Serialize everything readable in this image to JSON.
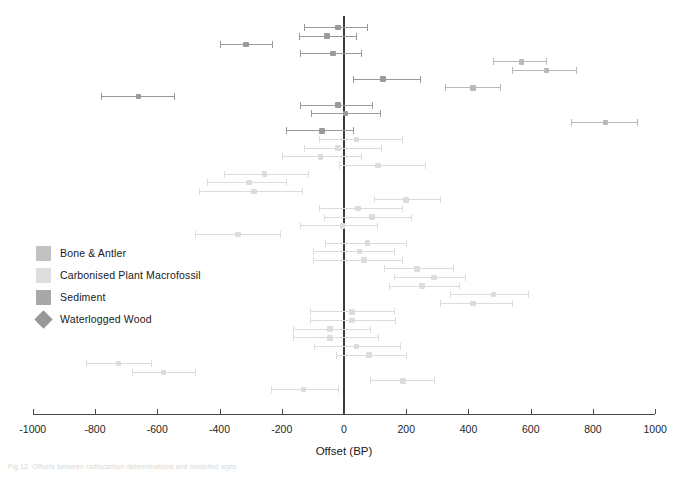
{
  "figure": {
    "caption": "Fig 12. Offsets between radiocarbon determinations and modelled ages"
  },
  "chart_data": {
    "type": "scatter",
    "title": "",
    "xlabel": "Offset (BP)",
    "ylabel": "",
    "xlim": [
      -1000,
      1000
    ],
    "xticks": [
      -1000,
      -800,
      -600,
      -400,
      -200,
      0,
      200,
      400,
      600,
      800,
      1000
    ],
    "xticklabels": [
      "-1000",
      "-800",
      "-600",
      "-400",
      "-200",
      "0",
      "200",
      "400",
      "600",
      "800",
      "1000"
    ],
    "grid": false,
    "reference_line": 0,
    "legend_position": "left-middle",
    "orientation": "horizontal-error-bars",
    "error_bar_note": "Each row shows a central offset estimate with a horizontal uncertainty interval.",
    "series": [
      {
        "name": "Bone & Antler",
        "color": "#b9b9b9",
        "marker": "square"
      },
      {
        "name": "Carbonised Plant Macrofossil",
        "color": "#dcdcdc",
        "marker": "square"
      },
      {
        "name": "Sediment",
        "color": "#9a9a9a",
        "marker": "square"
      },
      {
        "name": "Waterlogged Wood",
        "color": "#8e8e8e",
        "marker": "diamond"
      }
    ],
    "points": [
      {
        "row": 1,
        "offset": -20,
        "low": -130,
        "high": 75,
        "series": "Sediment"
      },
      {
        "row": 2,
        "offset": -55,
        "low": -145,
        "high": 40,
        "series": "Sediment"
      },
      {
        "row": 3,
        "offset": -315,
        "low": -400,
        "high": -230,
        "series": "Sediment"
      },
      {
        "row": 4,
        "offset": -35,
        "low": -140,
        "high": 55,
        "series": "Sediment"
      },
      {
        "row": 5,
        "offset": 570,
        "low": 480,
        "high": 650,
        "series": "Bone & Antler"
      },
      {
        "row": 6,
        "offset": 650,
        "low": 540,
        "high": 745,
        "series": "Bone & Antler"
      },
      {
        "row": 7,
        "offset": 125,
        "low": 30,
        "high": 245,
        "series": "Sediment"
      },
      {
        "row": 8,
        "offset": 415,
        "low": 325,
        "high": 500,
        "series": "Bone & Antler"
      },
      {
        "row": 9,
        "offset": -660,
        "low": -780,
        "high": -545,
        "series": "Sediment"
      },
      {
        "row": 10,
        "offset": -20,
        "low": -140,
        "high": 90,
        "series": "Sediment"
      },
      {
        "row": 11,
        "offset": 5,
        "low": -105,
        "high": 115,
        "series": "Sediment"
      },
      {
        "row": 12,
        "offset": 840,
        "low": 730,
        "high": 940,
        "series": "Bone & Antler"
      },
      {
        "row": 13,
        "offset": -70,
        "low": -185,
        "high": 30,
        "series": "Sediment"
      },
      {
        "row": 14,
        "offset": 40,
        "low": -80,
        "high": 185,
        "series": "Carbonised Plant Macrofossil"
      },
      {
        "row": 15,
        "offset": -20,
        "low": -130,
        "high": 120,
        "series": "Carbonised Plant Macrofossil"
      },
      {
        "row": 16,
        "offset": -75,
        "low": -200,
        "high": 55,
        "series": "Carbonised Plant Macrofossil"
      },
      {
        "row": 17,
        "offset": 110,
        "low": -15,
        "high": 260,
        "series": "Carbonised Plant Macrofossil"
      },
      {
        "row": 18,
        "offset": -255,
        "low": -385,
        "high": -115,
        "series": "Carbonised Plant Macrofossil"
      },
      {
        "row": 19,
        "offset": -305,
        "low": -440,
        "high": -185,
        "series": "Carbonised Plant Macrofossil"
      },
      {
        "row": 20,
        "offset": -290,
        "low": -465,
        "high": -135,
        "series": "Carbonised Plant Macrofossil"
      },
      {
        "row": 21,
        "offset": 200,
        "low": 95,
        "high": 310,
        "series": "Carbonised Plant Macrofossil"
      },
      {
        "row": 22,
        "offset": 45,
        "low": -80,
        "high": 185,
        "series": "Carbonised Plant Macrofossil"
      },
      {
        "row": 23,
        "offset": 90,
        "low": -65,
        "high": 215,
        "series": "Carbonised Plant Macrofossil"
      },
      {
        "row": 24,
        "offset": -5,
        "low": -140,
        "high": 105,
        "series": "Carbonised Plant Macrofossil"
      },
      {
        "row": 25,
        "offset": -340,
        "low": -480,
        "high": -205,
        "series": "Carbonised Plant Macrofossil"
      },
      {
        "row": 26,
        "offset": 75,
        "low": -60,
        "high": 200,
        "series": "Carbonised Plant Macrofossil"
      },
      {
        "row": 27,
        "offset": 50,
        "low": -100,
        "high": 160,
        "series": "Carbonised Plant Macrofossil"
      },
      {
        "row": 28,
        "offset": 65,
        "low": -100,
        "high": 185,
        "series": "Carbonised Plant Macrofossil"
      },
      {
        "row": 29,
        "offset": 235,
        "low": 130,
        "high": 350,
        "series": "Carbonised Plant Macrofossil"
      },
      {
        "row": 30,
        "offset": 290,
        "low": 160,
        "high": 390,
        "series": "Carbonised Plant Macrofossil"
      },
      {
        "row": 31,
        "offset": 250,
        "low": 145,
        "high": 370,
        "series": "Carbonised Plant Macrofossil"
      },
      {
        "row": 32,
        "offset": 480,
        "low": 340,
        "high": 590,
        "series": "Carbonised Plant Macrofossil"
      },
      {
        "row": 33,
        "offset": 415,
        "low": 310,
        "high": 540,
        "series": "Carbonised Plant Macrofossil"
      },
      {
        "row": 34,
        "offset": 25,
        "low": -110,
        "high": 160,
        "series": "Carbonised Plant Macrofossil"
      },
      {
        "row": 35,
        "offset": 25,
        "low": -110,
        "high": 165,
        "series": "Carbonised Plant Macrofossil"
      },
      {
        "row": 36,
        "offset": -45,
        "low": -165,
        "high": 85,
        "series": "Carbonised Plant Macrofossil"
      },
      {
        "row": 37,
        "offset": -45,
        "low": -165,
        "high": 110,
        "series": "Carbonised Plant Macrofossil"
      },
      {
        "row": 38,
        "offset": 40,
        "low": -95,
        "high": 180,
        "series": "Carbonised Plant Macrofossil"
      },
      {
        "row": 39,
        "offset": 80,
        "low": -25,
        "high": 200,
        "series": "Carbonised Plant Macrofossil"
      },
      {
        "row": 40,
        "offset": -725,
        "low": -830,
        "high": -620,
        "series": "Carbonised Plant Macrofossil"
      },
      {
        "row": 41,
        "offset": -580,
        "low": -680,
        "high": -480,
        "series": "Carbonised Plant Macrofossil"
      },
      {
        "row": 42,
        "offset": 190,
        "low": 85,
        "high": 290,
        "series": "Carbonised Plant Macrofossil"
      },
      {
        "row": 43,
        "offset": -130,
        "low": -235,
        "high": -20,
        "series": "Carbonised Plant Macrofossil"
      }
    ]
  },
  "legend": {
    "items": [
      {
        "label": "Bone & Antler",
        "color": "#c2c2c2",
        "shape": "square"
      },
      {
        "label": "Carbonised Plant Macrofossil",
        "color": "#dedede",
        "shape": "square"
      },
      {
        "label": "Sediment",
        "color": "#a8a8a8",
        "shape": "square"
      },
      {
        "label": "Waterlogged Wood",
        "color": "#989898",
        "shape": "diamond"
      }
    ]
  },
  "axis": {
    "label": "Offset (BP)"
  },
  "geometry": {
    "x0_px": 344,
    "px_per_unit": 0.3112,
    "row_top_px": 27,
    "row_step_px": 8.62,
    "axis_y_px": 414,
    "zero_top_px": 16,
    "zero_bottom_px": 414
  }
}
